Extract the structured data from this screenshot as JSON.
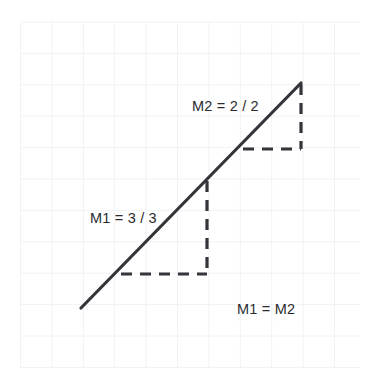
{
  "figure": {
    "background_color": "#ffffff",
    "grid": {
      "line_color": "#f1f2f4",
      "line_width": 1,
      "spacing_px": 31.4,
      "x_start": 20.5,
      "y_start": 22.0,
      "x_end": 360.5,
      "y_end": 368.0,
      "columns": 11,
      "rows": 11
    },
    "solid_line": {
      "name": "slope-line",
      "color": "#34343a",
      "width": 3.2,
      "x1": 81,
      "y1": 308,
      "x2": 301,
      "y2": 83
    },
    "rise_run_triangles": [
      {
        "name": "lower-triangle",
        "label": "M1",
        "rise": 3,
        "run": 3,
        "vertical_x": 207,
        "vertical_y_top": 181,
        "vertical_y_bottom": 274,
        "horizontal_y": 274,
        "horizontal_x_left": 121,
        "horizontal_x_right": 207,
        "dash_color": "#34343a",
        "dash_width": 3.2,
        "dash_pattern": "11 8"
      },
      {
        "name": "upper-triangle",
        "label": "M2",
        "rise": 2,
        "run": 2,
        "vertical_x": 301,
        "vertical_y_top": 84,
        "vertical_y_bottom": 149,
        "horizontal_y": 149,
        "horizontal_x_left": 243,
        "horizontal_x_right": 301,
        "dash_color": "#34343a",
        "dash_width": 3.2,
        "dash_pattern": "11 8"
      }
    ],
    "labels": [
      {
        "name": "m2-slope-label",
        "text": "M2 = 2 / 2",
        "x": 192,
        "y": 111,
        "color": "#2b2b2f",
        "font_size": 14.5
      },
      {
        "name": "m1-slope-label",
        "text": "M1 = 3 / 3",
        "x": 90,
        "y": 223,
        "color": "#2b2b2f",
        "font_size": 14.5
      },
      {
        "name": "equality-label",
        "text": "M1 = M2",
        "x": 237,
        "y": 314,
        "color": "#2b2b2f",
        "font_size": 14.5
      }
    ]
  },
  "chart_data": {
    "type": "line",
    "title": "M1 = M2",
    "xlabel": "",
    "ylabel": "",
    "grid": true,
    "legend_position": "none",
    "xlim": [
      0,
      11
    ],
    "ylim": [
      0,
      11
    ],
    "series": [
      {
        "name": "slope-line",
        "points": [
          [
            2,
            2
          ],
          [
            9,
            9
          ]
        ],
        "slope": 1
      }
    ],
    "annotations": [
      {
        "name": "m2-slope-label",
        "text": "M2 = 2 / 2",
        "rise": 2,
        "run": 2,
        "value": 1
      },
      {
        "name": "m1-slope-label",
        "text": "M1 = 3 / 3",
        "rise": 3,
        "run": 3,
        "value": 1
      },
      {
        "name": "equality-label",
        "text": "M1 = M2"
      }
    ]
  }
}
